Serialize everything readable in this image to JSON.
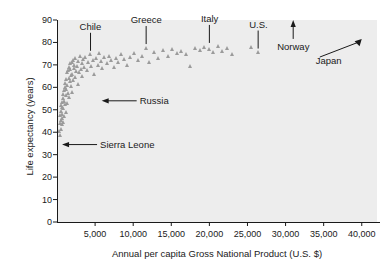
{
  "chart_data": {
    "type": "scatter",
    "title": "",
    "xlabel": "Annual per capita Gross National Product (U.S. $)",
    "ylabel": "Life expectancy (years)",
    "xlim": [
      0,
      42000
    ],
    "ylim": [
      0,
      90
    ],
    "xticks": [
      5000,
      10000,
      15000,
      20000,
      25000,
      30000,
      35000,
      40000
    ],
    "xtick_labels": [
      "5,000",
      "10,000",
      "15,000",
      "20,000",
      "25,000",
      "30,000",
      "35,000",
      "40,000"
    ],
    "yticks": [
      0,
      10,
      20,
      30,
      40,
      50,
      60,
      70,
      80,
      90
    ],
    "ytick_labels": [
      "0",
      "10",
      "20",
      "30",
      "40",
      "50",
      "60",
      "70",
      "80",
      "90"
    ],
    "grid": false,
    "legend": "none",
    "marker": "triangle",
    "marker_color": "#9b9b9b",
    "plot_background": "#ededed",
    "points": [
      [
        400,
        40.5
      ],
      [
        450,
        38.5
      ],
      [
        500,
        44.0
      ],
      [
        520,
        47.5
      ],
      [
        560,
        41.5
      ],
      [
        600,
        49.5
      ],
      [
        620,
        52.0
      ],
      [
        650,
        45.5
      ],
      [
        680,
        43.5
      ],
      [
        700,
        51.0
      ],
      [
        720,
        48.0
      ],
      [
        760,
        53.5
      ],
      [
        800,
        46.0
      ],
      [
        820,
        55.0
      ],
      [
        860,
        50.5
      ],
      [
        900,
        57.0
      ],
      [
        930,
        44.5
      ],
      [
        960,
        54.0
      ],
      [
        1000,
        58.5
      ],
      [
        1040,
        47.0
      ],
      [
        1080,
        60.0
      ],
      [
        1120,
        52.5
      ],
      [
        1160,
        62.0
      ],
      [
        1200,
        49.0
      ],
      [
        1240,
        56.5
      ],
      [
        1280,
        63.5
      ],
      [
        1320,
        59.0
      ],
      [
        1360,
        66.5
      ],
      [
        1400,
        53.0
      ],
      [
        1450,
        61.0
      ],
      [
        1500,
        67.5
      ],
      [
        1550,
        57.5
      ],
      [
        1600,
        64.0
      ],
      [
        1650,
        69.0
      ],
      [
        1700,
        55.5
      ],
      [
        1750,
        62.5
      ],
      [
        1800,
        68.0
      ],
      [
        1850,
        70.5
      ],
      [
        1900,
        60.5
      ],
      [
        1950,
        65.5
      ],
      [
        2000,
        71.0
      ],
      [
        2050,
        58.0
      ],
      [
        2100,
        66.0
      ],
      [
        2150,
        72.0
      ],
      [
        2200,
        63.0
      ],
      [
        2250,
        68.5
      ],
      [
        2300,
        70.0
      ],
      [
        2400,
        64.5
      ],
      [
        2500,
        73.0
      ],
      [
        2600,
        67.0
      ],
      [
        2700,
        69.5
      ],
      [
        2800,
        61.5
      ],
      [
        2900,
        71.5
      ],
      [
        3000,
        66.5
      ],
      [
        3100,
        74.0
      ],
      [
        3200,
        68.0
      ],
      [
        3300,
        70.5
      ],
      [
        3400,
        65.0
      ],
      [
        3500,
        72.5
      ],
      [
        3600,
        69.0
      ],
      [
        3800,
        73.5
      ],
      [
        4000,
        67.5
      ],
      [
        4200,
        71.0
      ],
      [
        4400,
        74.5
      ],
      [
        4600,
        69.5
      ],
      [
        4800,
        72.0
      ],
      [
        5000,
        66.0
      ],
      [
        5200,
        73.0
      ],
      [
        5400,
        70.0
      ],
      [
        5600,
        75.0
      ],
      [
        5800,
        71.5
      ],
      [
        6000,
        68.5
      ],
      [
        6300,
        73.5
      ],
      [
        6600,
        70.5
      ],
      [
        6900,
        74.0
      ],
      [
        7200,
        72.0
      ],
      [
        7500,
        69.0
      ],
      [
        7800,
        73.0
      ],
      [
        8100,
        71.0
      ],
      [
        8500,
        74.5
      ],
      [
        8900,
        72.5
      ],
      [
        9300,
        70.0
      ],
      [
        9700,
        73.5
      ],
      [
        10200,
        75.0
      ],
      [
        10700,
        72.0
      ],
      [
        11200,
        74.0
      ],
      [
        11700,
        77.5
      ],
      [
        12200,
        71.0
      ],
      [
        12800,
        75.5
      ],
      [
        13400,
        73.0
      ],
      [
        14000,
        76.5
      ],
      [
        14600,
        74.0
      ],
      [
        15200,
        77.0
      ],
      [
        15800,
        75.0
      ],
      [
        16400,
        76.0
      ],
      [
        17000,
        74.5
      ],
      [
        17600,
        69.5
      ],
      [
        18200,
        77.5
      ],
      [
        18800,
        76.5
      ],
      [
        19400,
        78.0
      ],
      [
        20000,
        77.0
      ],
      [
        20600,
        75.5
      ],
      [
        21200,
        78.5
      ],
      [
        21800,
        76.0
      ],
      [
        22400,
        77.5
      ],
      [
        23000,
        74.5
      ],
      [
        25600,
        78.0
      ],
      [
        26400,
        75.5
      ]
    ],
    "annotations": [
      {
        "name": "Chile",
        "label": "Chile",
        "pointer": "line-down",
        "point_gnp": 4400,
        "point_life": 74.5
      },
      {
        "name": "Greece",
        "label": "Greece",
        "pointer": "line-down",
        "point_gnp": 11700,
        "point_life": 77.5
      },
      {
        "name": "Italy",
        "label": "Italy",
        "pointer": "line-down",
        "point_gnp": 20000,
        "point_life": 78.0
      },
      {
        "name": "U.S.",
        "label": "U.S.",
        "pointer": "line-down",
        "point_gnp": 26400,
        "point_life": 75.5
      },
      {
        "name": "Norway",
        "label": "Norway",
        "pointer": "arrow-up",
        "point_gnp": 31000,
        "point_life": 78.0
      },
      {
        "name": "Japan",
        "label": "Japan",
        "pointer": "arrow-up-right",
        "point_gnp": 40000,
        "point_life": 81.5
      },
      {
        "name": "Russia",
        "label": "Russia",
        "pointer": "arrow-left",
        "point_gnp": 5600,
        "point_life": 54.0
      },
      {
        "name": "Sierra Leone",
        "label": "Sierra Leone",
        "pointer": "arrow-left",
        "point_gnp": 400,
        "point_life": 34.5
      }
    ]
  }
}
